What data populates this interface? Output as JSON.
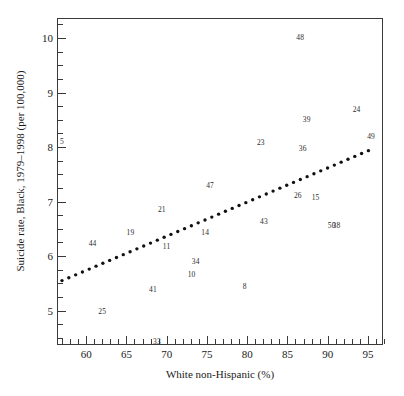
{
  "chart_data": {
    "type": "scatter",
    "title": "",
    "xlabel": "White non-Hispanic (%)",
    "ylabel": "Suicide rate, Black, 1979–1998 (per 100,000)",
    "xlim": [
      56.5,
      97.0
    ],
    "ylim": [
      4.35,
      10.35
    ],
    "grid": false,
    "legend": null,
    "point_style": "numeric-label",
    "xticks": [
      60,
      65,
      70,
      75,
      80,
      85,
      90,
      95
    ],
    "xtick_labels": [
      "60",
      "65",
      "70",
      "75",
      "80",
      "85",
      "90",
      "95"
    ],
    "xminor_step": 1,
    "yticks": [
      5,
      6,
      7,
      8,
      9,
      10
    ],
    "ytick_labels": [
      "5",
      "6",
      "7",
      "8",
      "9",
      "10"
    ],
    "yminor_step": 0.25,
    "points": [
      {
        "label": "5",
        "x": 57.0,
        "y": 8.1
      },
      {
        "label": "44",
        "x": 60.8,
        "y": 6.22
      },
      {
        "label": "25",
        "x": 62.0,
        "y": 4.98
      },
      {
        "label": "19",
        "x": 65.5,
        "y": 6.42
      },
      {
        "label": "41",
        "x": 68.3,
        "y": 5.38
      },
      {
        "label": "33",
        "x": 68.8,
        "y": 4.43
      },
      {
        "label": "21",
        "x": 69.4,
        "y": 6.84
      },
      {
        "label": "11",
        "x": 70.0,
        "y": 6.16
      },
      {
        "label": "10",
        "x": 73.1,
        "y": 5.66
      },
      {
        "label": "34",
        "x": 73.6,
        "y": 5.9
      },
      {
        "label": "14",
        "x": 74.8,
        "y": 6.42
      },
      {
        "label": "47",
        "x": 75.4,
        "y": 7.28
      },
      {
        "label": "8",
        "x": 79.7,
        "y": 5.44
      },
      {
        "label": "23",
        "x": 81.7,
        "y": 8.08
      },
      {
        "label": "43",
        "x": 82.1,
        "y": 6.62
      },
      {
        "label": "26",
        "x": 86.3,
        "y": 7.1
      },
      {
        "label": "48",
        "x": 86.6,
        "y": 10.0
      },
      {
        "label": "36",
        "x": 86.9,
        "y": 7.96
      },
      {
        "label": "39",
        "x": 87.4,
        "y": 8.5
      },
      {
        "label": "15",
        "x": 88.5,
        "y": 7.06
      },
      {
        "label": "50",
        "x": 90.5,
        "y": 6.56
      },
      {
        "label": "38",
        "x": 91.1,
        "y": 6.56
      },
      {
        "label": "24",
        "x": 93.6,
        "y": 8.68
      },
      {
        "label": "49",
        "x": 95.4,
        "y": 8.18
      }
    ],
    "trend_line": {
      "style": "dotted",
      "x_start": 57.0,
      "y_start": 5.52,
      "x_end": 95.3,
      "y_end": 7.92,
      "dot_count": 46,
      "color": "#111111"
    }
  }
}
